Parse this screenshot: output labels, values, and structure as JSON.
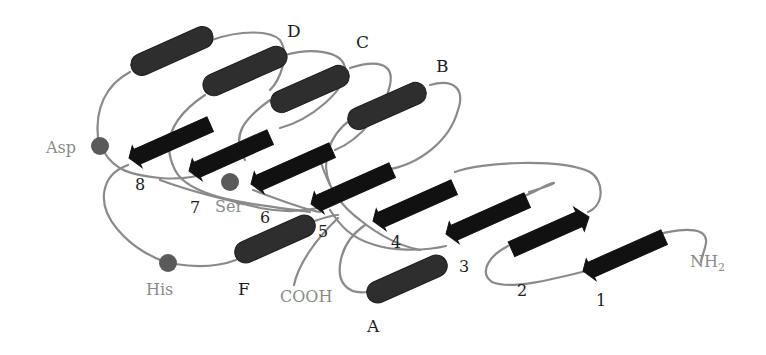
{
  "diagram": {
    "helix_labels": [
      "A",
      "B",
      "C",
      "D",
      "F"
    ],
    "strand_labels": [
      "1",
      "2",
      "3",
      "4",
      "5",
      "6",
      "7",
      "8"
    ],
    "catalytic_residues": [
      "Ser",
      "Asp",
      "His"
    ],
    "termini": {
      "n_terminus": "NH",
      "n_terminus_sub": "2",
      "c_terminus": "COOH"
    },
    "labels": {
      "A": "A",
      "B": "B",
      "C": "C",
      "D": "D",
      "F": "F",
      "s1": "1",
      "s2": "2",
      "s3": "3",
      "s4": "4",
      "s5": "5",
      "s6": "6",
      "s7": "7",
      "s8": "8",
      "ser": "Ser",
      "asp": "Asp",
      "his": "His"
    },
    "colors": {
      "loop": "#8a8a8a",
      "helix": "#2e2e2e",
      "strand": "#111111",
      "residue": "#5a5a5a",
      "grey_label": "#8a8a8a",
      "dark_label": "#1e1e1e"
    }
  }
}
